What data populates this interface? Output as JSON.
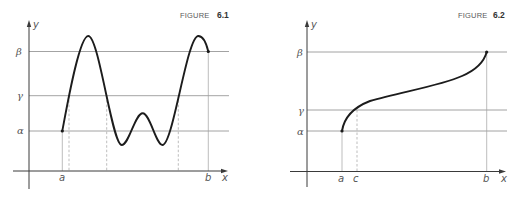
{
  "figures": [
    {
      "caption_word": "FIGURE",
      "caption_number": "6.1",
      "y_axis_label": "y",
      "x_axis_label": "x",
      "levels": {
        "beta": "β",
        "gamma": "γ",
        "alpha": "α"
      },
      "points": {
        "a": "a",
        "b": "b"
      },
      "description": "Oscillating continuous curve from (a, α) to (b, β) crossing level γ three times"
    },
    {
      "caption_word": "FIGURE",
      "caption_number": "6.2",
      "y_axis_label": "y",
      "x_axis_label": "x",
      "levels": {
        "beta": "β",
        "gamma": "γ",
        "alpha": "α"
      },
      "points": {
        "a": "a",
        "c": "c",
        "b": "b"
      },
      "description": "Increasing continuous curve from (a, α) to (b, β) crossing level γ once at x = c"
    }
  ],
  "colors": {
    "curve": "#1c1c1c",
    "axis": "#3a3a3a",
    "level_lines": "#8c8c8c",
    "labels": "#555555"
  }
}
